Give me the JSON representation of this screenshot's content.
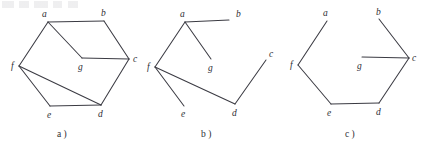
{
  "figure": {
    "background_color": "#ffffff",
    "line_color": "#3b3b43",
    "label_color": "#2e2e33"
  },
  "panels": [
    {
      "id": "a",
      "caption": "a )",
      "caption_x": 57,
      "caption_y": 137,
      "vertices": [
        {
          "id": "a",
          "x": 48,
          "y": 22,
          "label": "a",
          "label_x": 42,
          "label_y": 17
        },
        {
          "id": "b",
          "x": 104,
          "y": 21,
          "label": "b",
          "label_x": 101,
          "label_y": 16
        },
        {
          "id": "c",
          "x": 129,
          "y": 59,
          "label": "c",
          "label_x": 133,
          "label_y": 62
        },
        {
          "id": "d",
          "x": 101,
          "y": 105,
          "label": "d",
          "label_x": 98,
          "label_y": 117
        },
        {
          "id": "e",
          "x": 50,
          "y": 106,
          "label": "e",
          "label_x": 47,
          "label_y": 118
        },
        {
          "id": "f",
          "x": 19,
          "y": 66,
          "label": "f",
          "label_x": 11,
          "label_y": 69
        },
        {
          "id": "g",
          "x": 82,
          "y": 58,
          "label": "g",
          "label_x": 78,
          "label_y": 70
        }
      ],
      "edges": [
        {
          "from": "a",
          "to": "b"
        },
        {
          "from": "b",
          "to": "c"
        },
        {
          "from": "c",
          "to": "d"
        },
        {
          "from": "d",
          "to": "e"
        },
        {
          "from": "e",
          "to": "f"
        },
        {
          "from": "f",
          "to": "a"
        },
        {
          "from": "a",
          "to": "g"
        },
        {
          "from": "g",
          "to": "c"
        },
        {
          "from": "f",
          "to": "d"
        }
      ]
    },
    {
      "id": "b",
      "caption": "b )",
      "caption_x": 201,
      "caption_y": 137,
      "vertices": [
        {
          "id": "a",
          "x": 185,
          "y": 22,
          "label": "a",
          "label_x": 180,
          "label_y": 17
        },
        {
          "id": "b",
          "x": 229,
          "y": 20,
          "label": "b",
          "label_x": 236,
          "label_y": 17
        },
        {
          "id": "c",
          "x": 266,
          "y": 60,
          "label": "c",
          "label_x": 269,
          "label_y": 57
        },
        {
          "id": "d",
          "x": 235,
          "y": 104,
          "label": "d",
          "label_x": 232,
          "label_y": 116
        },
        {
          "id": "e",
          "x": 184,
          "y": 106,
          "label": "e",
          "label_x": 181,
          "label_y": 117
        },
        {
          "id": "f",
          "x": 155,
          "y": 67,
          "label": "f",
          "label_x": 147,
          "label_y": 70
        },
        {
          "id": "g",
          "x": 211,
          "y": 59,
          "label": "g",
          "label_x": 208,
          "label_y": 71
        }
      ],
      "edges": [
        {
          "from": "a",
          "to": "b"
        },
        {
          "from": "a",
          "to": "f"
        },
        {
          "from": "a",
          "to": "g"
        },
        {
          "from": "f",
          "to": "e"
        },
        {
          "from": "f",
          "to": "d"
        },
        {
          "from": "d",
          "to": "c"
        }
      ]
    },
    {
      "id": "c",
      "caption": "c )",
      "caption_x": 345,
      "caption_y": 137,
      "vertices": [
        {
          "id": "a",
          "x": 327,
          "y": 21,
          "label": "a",
          "label_x": 323,
          "label_y": 16
        },
        {
          "id": "b",
          "x": 379,
          "y": 19,
          "label": "b",
          "label_x": 376,
          "label_y": 15
        },
        {
          "id": "c",
          "x": 409,
          "y": 58,
          "label": "c",
          "label_x": 412,
          "label_y": 61
        },
        {
          "id": "d",
          "x": 379,
          "y": 103,
          "label": "d",
          "label_x": 376,
          "label_y": 115
        },
        {
          "id": "e",
          "x": 331,
          "y": 104,
          "label": "e",
          "label_x": 327,
          "label_y": 116
        },
        {
          "id": "f",
          "x": 298,
          "y": 65,
          "label": "f",
          "label_x": 290,
          "label_y": 68
        },
        {
          "id": "g",
          "x": 362,
          "y": 57,
          "label": "g",
          "label_x": 357,
          "label_y": 69
        }
      ],
      "edges": [
        {
          "from": "a",
          "to": "f"
        },
        {
          "from": "f",
          "to": "e"
        },
        {
          "from": "e",
          "to": "d"
        },
        {
          "from": "d",
          "to": "c"
        },
        {
          "from": "c",
          "to": "b"
        },
        {
          "from": "c",
          "to": "g"
        }
      ]
    }
  ]
}
